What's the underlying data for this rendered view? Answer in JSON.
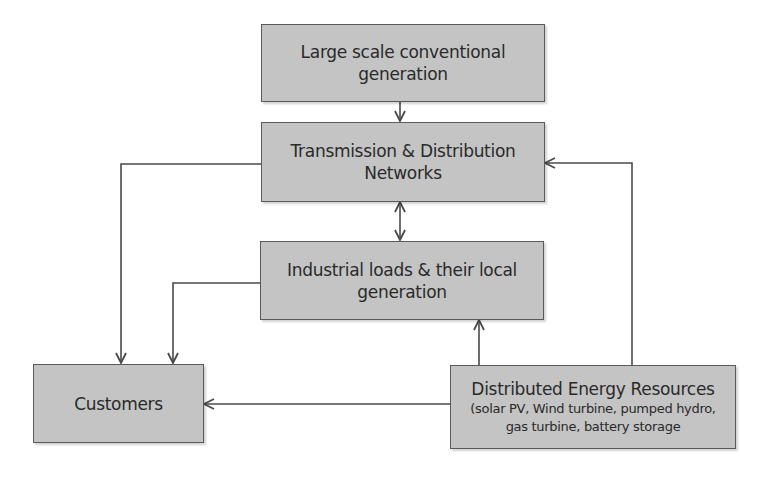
{
  "diagram": {
    "nodes": [
      {
        "id": "large-scale",
        "title": "Large scale conventional generation"
      },
      {
        "id": "td-networks",
        "title": "Transmission & Distribution Networks"
      },
      {
        "id": "industrial",
        "title": "Industrial loads & their local generation"
      },
      {
        "id": "customers",
        "title": "Customers"
      },
      {
        "id": "der",
        "title": "Distributed Energy Resources",
        "subtitle_line1": "(solar PV, Wind turbine, pumped hydro,",
        "subtitle_line2": "gas turbine, battery storage"
      }
    ],
    "edges": [
      {
        "from": "large-scale",
        "to": "td-networks",
        "direction": "one-way"
      },
      {
        "from": "td-networks",
        "to": "industrial",
        "direction": "two-way"
      },
      {
        "from": "td-networks",
        "to": "customers",
        "direction": "one-way"
      },
      {
        "from": "industrial",
        "to": "customers",
        "direction": "one-way"
      },
      {
        "from": "der",
        "to": "customers",
        "direction": "one-way"
      },
      {
        "from": "der",
        "to": "industrial",
        "direction": "one-way"
      },
      {
        "from": "der",
        "to": "td-networks",
        "direction": "one-way"
      }
    ],
    "colors": {
      "box_fill": "#c4c4c4",
      "box_border": "#5a5a5a",
      "line": "#4a4a4a",
      "text": "#2a2a2a"
    }
  },
  "labels": {
    "large_scale_l1": "Large scale conventional",
    "large_scale_l2": "generation",
    "td_l1": "Transmission & Distribution",
    "td_l2": "Networks",
    "industrial_l1": "Industrial loads & their local",
    "industrial_l2": "generation",
    "customers": "Customers",
    "der_title": "Distributed Energy Resources",
    "der_sub1": "(solar PV, Wind turbine, pumped hydro,",
    "der_sub2": "gas turbine, battery storage"
  }
}
